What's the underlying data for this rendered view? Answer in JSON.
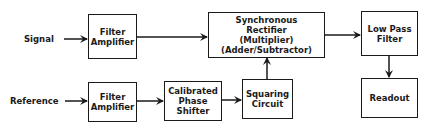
{
  "diagram": {
    "inputs": {
      "signal": "Signal",
      "reference": "Reference"
    },
    "blocks": {
      "filter_amp_signal": [
        "Filter",
        "Amplifier"
      ],
      "filter_amp_reference": [
        "Filter",
        "Amplifier"
      ],
      "phase_shifter": [
        "Calibrated",
        "Phase",
        "Shifter"
      ],
      "squaring_circuit": [
        "Squaring",
        "Circuit"
      ],
      "sync_rectifier": [
        "Synchronous",
        "Rectifier",
        "(Multiplier)",
        "(Adder/Subtractor)"
      ],
      "low_pass_filter": [
        "Low Pass",
        "Filter"
      ],
      "readout": [
        "Readout"
      ]
    },
    "connections": [
      [
        "Signal",
        "Filter Amplifier (signal)"
      ],
      [
        "Filter Amplifier (signal)",
        "Synchronous Rectifier"
      ],
      [
        "Reference",
        "Filter Amplifier (reference)"
      ],
      [
        "Filter Amplifier (reference)",
        "Calibrated Phase Shifter"
      ],
      [
        "Calibrated Phase Shifter",
        "Squaring Circuit"
      ],
      [
        "Squaring Circuit",
        "Synchronous Rectifier"
      ],
      [
        "Synchronous Rectifier",
        "Low Pass Filter"
      ],
      [
        "Low Pass Filter",
        "Readout"
      ]
    ]
  }
}
